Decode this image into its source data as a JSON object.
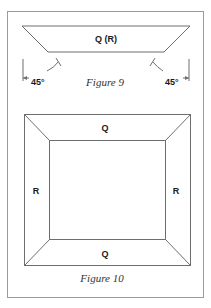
{
  "figure9": {
    "piece_label": "Q (R)",
    "angle_left": "45°",
    "angle_right": "45°",
    "caption": "Figure 9"
  },
  "figure10": {
    "top_label": "Q",
    "bottom_label": "Q",
    "left_label": "R",
    "right_label": "R",
    "caption": "Figure 10"
  },
  "colors": {
    "frame": "#9a9a9a",
    "line": "#6e6e6e",
    "text": "#1a1a1a",
    "caption": "#333333",
    "background": "#ffffff"
  }
}
